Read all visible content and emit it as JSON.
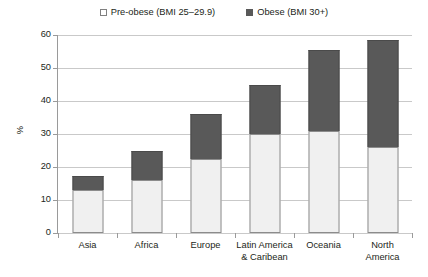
{
  "chart_data": {
    "type": "bar",
    "subtype": "stacked-vertical",
    "title": "",
    "subtitle": "",
    "xlabel": "",
    "ylabel": "%",
    "ylim": [
      0,
      60
    ],
    "yticks": [
      0,
      10,
      20,
      30,
      40,
      50,
      60
    ],
    "ytick_labels": [
      "0",
      "10",
      "20",
      "30",
      "40",
      "50",
      "60"
    ],
    "grid": true,
    "legend_position": "top-center",
    "categories": [
      "Asia",
      "Africa",
      "Europe",
      "Latin America & Caribean",
      "Oceania",
      "North America"
    ],
    "category_lines": [
      [
        "Asia"
      ],
      [
        "Africa"
      ],
      [
        "Europe"
      ],
      [
        "Latin America",
        "& Caribean"
      ],
      [
        "Oceania"
      ],
      [
        "North",
        "America"
      ]
    ],
    "series": [
      {
        "name": "Pre-obese (BMI 25–29.9)",
        "color": "#f0f0f0",
        "marker": "open-square",
        "values": [
          13.0,
          16.0,
          22.5,
          30.0,
          31.0,
          26.0
        ]
      },
      {
        "name": "Obese (BMI 30+)",
        "color": "#595959",
        "marker": "filled-square",
        "values": [
          4.3,
          9.0,
          13.5,
          15.0,
          24.5,
          32.5
        ]
      }
    ],
    "totals": [
      17.3,
      25.0,
      36.0,
      45.0,
      55.5,
      58.5
    ]
  },
  "legend": {
    "items": [
      {
        "label": "Pre-obese (BMI 25–29.9)",
        "swatch": "open-square"
      },
      {
        "label": "Obese (BMI 30+)",
        "swatch": "filled-square"
      }
    ]
  },
  "colors": {
    "pre_obese": "#f0f0f0",
    "obese": "#595959",
    "gridline": "#c9c9c9",
    "axis": "#9a9a9a",
    "background": "#ffffff",
    "text": "#231f20"
  }
}
